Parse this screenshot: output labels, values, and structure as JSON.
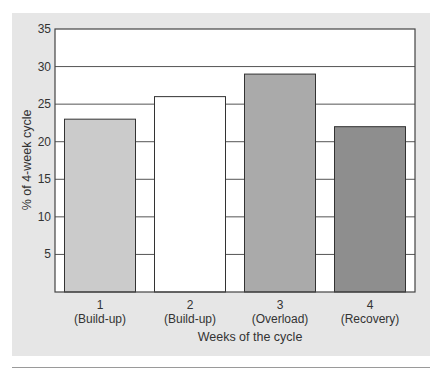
{
  "chart_data": {
    "type": "bar",
    "title": "",
    "xlabel": "Weeks of the cycle",
    "ylabel": "% of 4-week cycle",
    "ylim": [
      0,
      35
    ],
    "yticks": [
      5,
      10,
      15,
      20,
      25,
      30,
      35
    ],
    "grid": true,
    "legend": "none",
    "categories": [
      {
        "number": "1",
        "phase": "(Build-up)"
      },
      {
        "number": "2",
        "phase": "(Build-up)"
      },
      {
        "number": "3",
        "phase": "(Overload)"
      },
      {
        "number": "4",
        "phase": "(Recovery)"
      }
    ],
    "values": [
      23,
      26,
      29,
      22
    ],
    "bar_colors": [
      "#cbcbcb",
      "#ffffff",
      "#aaaaaa",
      "#8e8e8e"
    ]
  }
}
